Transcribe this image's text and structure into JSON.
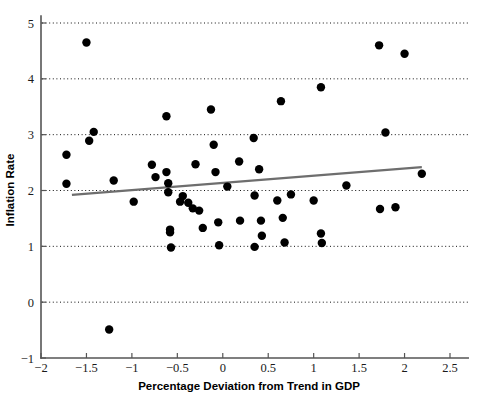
{
  "chart_data": {
    "type": "scatter",
    "title": "",
    "xlabel": "Percentage Deviation from Trend in GDP",
    "ylabel": "Inflation Rate",
    "xlim": [
      -2,
      2.7
    ],
    "ylim": [
      -1,
      5.2
    ],
    "xticks": [
      -2,
      -1.5,
      -1,
      -0.5,
      0,
      0.5,
      1,
      1.5,
      2,
      2.5
    ],
    "xticklabels": [
      "−2",
      "−1.5",
      "−1",
      "−0.5",
      "0",
      "0.5",
      "1",
      "1.5",
      "2",
      "2.5"
    ],
    "yticks": [
      -1,
      0,
      1,
      2,
      3,
      4,
      5
    ],
    "yticklabels": [
      "−1",
      "0",
      "1",
      "2",
      "3",
      "4",
      "5"
    ],
    "grid": "horizontal-dotted",
    "legend": "none",
    "marker_color": "#000000",
    "marker_size": 4.2,
    "trendline": {
      "name": "linear fit",
      "color": "#6e6e6e",
      "x0": -1.66,
      "y0": 1.92,
      "x1": 2.19,
      "y1": 2.42
    },
    "points": [
      [
        -1.72,
        2.64
      ],
      [
        -1.72,
        2.12
      ],
      [
        -1.5,
        4.65
      ],
      [
        -1.47,
        2.89
      ],
      [
        -1.42,
        3.05
      ],
      [
        -1.25,
        -0.49
      ],
      [
        -1.2,
        2.18
      ],
      [
        -0.98,
        1.8
      ],
      [
        -0.78,
        2.46
      ],
      [
        -0.74,
        2.24
      ],
      [
        -0.62,
        3.33
      ],
      [
        -0.62,
        2.33
      ],
      [
        -0.6,
        2.13
      ],
      [
        -0.6,
        1.97
      ],
      [
        -0.58,
        1.3
      ],
      [
        -0.58,
        1.25
      ],
      [
        -0.57,
        0.98
      ],
      [
        -0.47,
        1.8
      ],
      [
        -0.44,
        1.9
      ],
      [
        -0.38,
        1.78
      ],
      [
        -0.33,
        1.68
      ],
      [
        -0.3,
        2.47
      ],
      [
        -0.26,
        1.64
      ],
      [
        -0.22,
        1.33
      ],
      [
        -0.13,
        3.45
      ],
      [
        -0.1,
        2.82
      ],
      [
        -0.08,
        2.33
      ],
      [
        -0.05,
        1.43
      ],
      [
        -0.04,
        1.02
      ],
      [
        0.05,
        2.07
      ],
      [
        0.18,
        2.52
      ],
      [
        0.19,
        1.46
      ],
      [
        0.34,
        2.94
      ],
      [
        0.35,
        1.91
      ],
      [
        0.35,
        0.99
      ],
      [
        0.4,
        2.38
      ],
      [
        0.42,
        1.46
      ],
      [
        0.43,
        1.19
      ],
      [
        0.6,
        1.82
      ],
      [
        0.64,
        3.6
      ],
      [
        0.66,
        1.51
      ],
      [
        0.68,
        1.07
      ],
      [
        0.75,
        1.93
      ],
      [
        1.0,
        1.82
      ],
      [
        1.08,
        3.85
      ],
      [
        1.08,
        1.23
      ],
      [
        1.09,
        1.06
      ],
      [
        1.36,
        2.09
      ],
      [
        1.72,
        4.6
      ],
      [
        1.73,
        1.67
      ],
      [
        1.79,
        3.04
      ],
      [
        1.9,
        1.7
      ],
      [
        2.0,
        4.45
      ],
      [
        2.19,
        2.3
      ]
    ]
  }
}
